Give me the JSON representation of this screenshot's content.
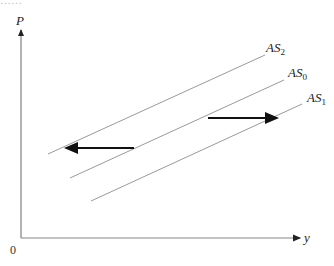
{
  "header_fragment": "……",
  "axes": {
    "y_label": "P",
    "x_label": "y",
    "origin_label": "0"
  },
  "curves": [
    {
      "name": "AS",
      "sub": "2",
      "x1": 48,
      "y1": 154,
      "x2": 265,
      "y2": 55
    },
    {
      "name": "AS",
      "sub": "0",
      "x1": 70,
      "y1": 178,
      "x2": 284,
      "y2": 80
    },
    {
      "name": "AS",
      "sub": "1",
      "x1": 91,
      "y1": 201,
      "x2": 302,
      "y2": 104
    }
  ],
  "arrows": [
    {
      "name": "shift-left",
      "x1": 134,
      "y1": 148,
      "x2": 66,
      "y2": 148
    },
    {
      "name": "shift-right",
      "x1": 208,
      "y1": 118,
      "x2": 277,
      "y2": 118
    }
  ],
  "colors": {
    "curve": "#9a9a9a",
    "arrow": "#111111",
    "axis": "#666666"
  }
}
